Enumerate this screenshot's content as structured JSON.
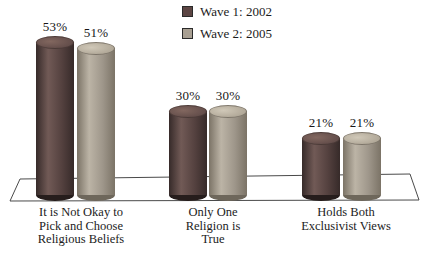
{
  "legend": {
    "items": [
      {
        "key": "wave1",
        "label": "Wave 1: 2002",
        "color": "#5c4543"
      },
      {
        "key": "wave2",
        "label": "Wave 2: 2005",
        "color": "#a89f92"
      }
    ]
  },
  "chart_data": {
    "type": "bar",
    "style": "3d-cylinder",
    "unit": "%",
    "title": "",
    "xlabel": "",
    "ylabel": "",
    "axes_visible": false,
    "floor": "white perspective parallelogram with thin dark outline",
    "legend_position": "top-center",
    "categories": [
      "It is Not Okay to Pick and Choose Religious Beliefs",
      "Only One Religion is True",
      "Holds Both Exclusivist Views"
    ],
    "categories_display": [
      [
        "It is Not Okay to",
        "Pick and Choose",
        "Religious Beliefs"
      ],
      [
        "Only One",
        "Religion is",
        "True"
      ],
      [
        "Holds Both",
        "Exclusivist Views"
      ]
    ],
    "series": [
      {
        "key": "wave1",
        "name": "Wave 1: 2002",
        "values": [
          53,
          30,
          21
        ],
        "value_labels": [
          "53%",
          "30%",
          "21%"
        ],
        "colors": {
          "dark_edge": "#362a29",
          "highlight": "#715a56",
          "mid": "#54413f",
          "bottom": "#261d1c",
          "cap": "#5e4947",
          "cap_light": "#82675f"
        }
      },
      {
        "key": "wave2",
        "name": "Wave 2: 2005",
        "values": [
          51,
          30,
          21
        ],
        "value_labels": [
          "51%",
          "30%",
          "21%"
        ],
        "colors": {
          "dark_edge": "#7b7366",
          "highlight": "#bcb4a6",
          "mid": "#9e968a",
          "bottom": "#6e675b",
          "cap": "#aca393",
          "cap_light": "#d0c8b8"
        }
      }
    ]
  }
}
